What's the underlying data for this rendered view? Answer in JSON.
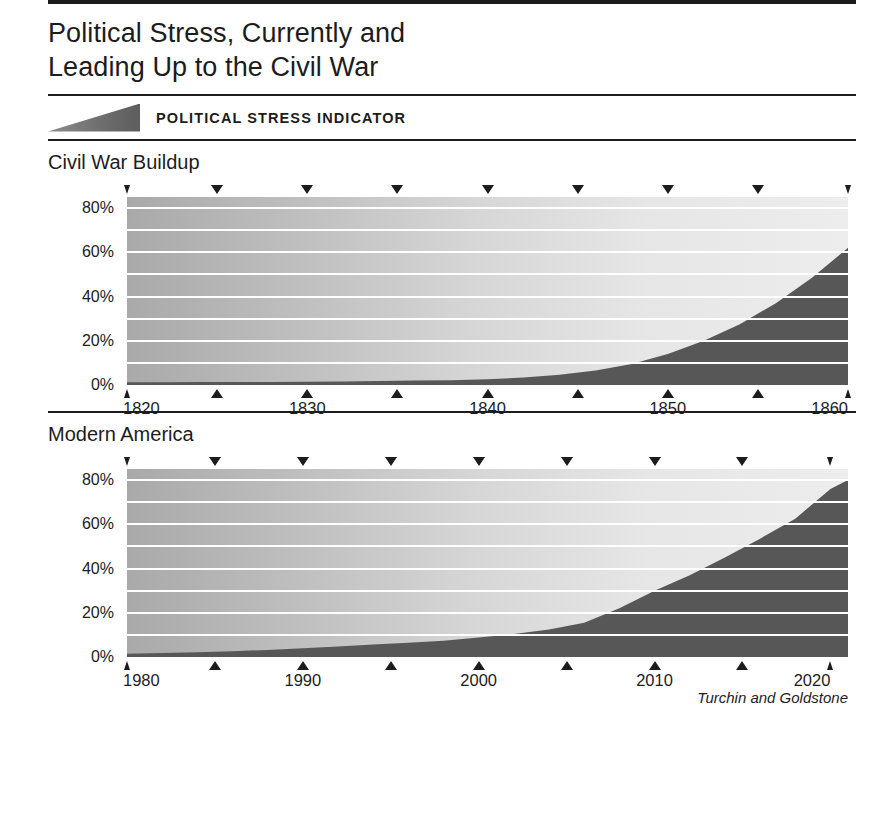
{
  "header": {
    "title_line1": "Political Stress, Currently and",
    "title_line2": "Leading Up to the Civil War"
  },
  "legend": {
    "label": "POLITICAL STRESS INDICATOR",
    "wedge_icon": "wedge-ramp-icon"
  },
  "credit": "Turchin and Goldstone",
  "colors": {
    "ink": "#1c1c1c",
    "dark_area": "#575757",
    "light_area_left": "#a9a9a9",
    "light_area_right": "#ededed",
    "gridline": "#ffffff"
  },
  "chart_data": [
    {
      "type": "area",
      "title": "Civil War Buildup",
      "xlabel": "",
      "ylabel": "",
      "xlim": [
        1820,
        1860
      ],
      "ylim": [
        0,
        85
      ],
      "grid": true,
      "gridlines": [
        0,
        10,
        20,
        30,
        40,
        50,
        60,
        70,
        80
      ],
      "ytick_labels": [
        "0%",
        "20%",
        "40%",
        "60%",
        "80%"
      ],
      "ytick_values": [
        0,
        20,
        40,
        60,
        80
      ],
      "xtick_values": [
        1820,
        1825,
        1830,
        1835,
        1840,
        1845,
        1850,
        1855,
        1860
      ],
      "xtick_labels": [
        "1820",
        "",
        "1830",
        "",
        "1840",
        "",
        "1850",
        "",
        "1860"
      ],
      "legend_position": "top",
      "series": [
        {
          "name": "Political Stress Indicator",
          "x": [
            1820,
            1822,
            1824,
            1826,
            1828,
            1830,
            1832,
            1834,
            1836,
            1838,
            1840,
            1842,
            1844,
            1846,
            1848,
            1850,
            1852,
            1854,
            1856,
            1858,
            1860
          ],
          "values": [
            1.2,
            1.2,
            1.3,
            1.3,
            1.4,
            1.5,
            1.6,
            1.8,
            2.0,
            2.2,
            2.6,
            3.4,
            4.6,
            6.5,
            9.5,
            14.0,
            20.0,
            27.5,
            37.0,
            48.5,
            62.0
          ]
        }
      ]
    },
    {
      "type": "area",
      "title": "Modern America",
      "xlabel": "",
      "ylabel": "",
      "xlim": [
        1980,
        2021
      ],
      "ylim": [
        0,
        85
      ],
      "grid": true,
      "gridlines": [
        0,
        10,
        20,
        30,
        40,
        50,
        60,
        70,
        80
      ],
      "ytick_labels": [
        "0%",
        "20%",
        "40%",
        "60%",
        "80%"
      ],
      "ytick_values": [
        0,
        20,
        40,
        60,
        80
      ],
      "xtick_values": [
        1980,
        1985,
        1990,
        1995,
        2000,
        2005,
        2010,
        2015,
        2020
      ],
      "xtick_labels": [
        "1980",
        "",
        "1990",
        "",
        "2000",
        "",
        "2010",
        "",
        "2020"
      ],
      "legend_position": "top",
      "series": [
        {
          "name": "Political Stress Indicator",
          "x": [
            1980,
            1982,
            1984,
            1986,
            1988,
            1990,
            1992,
            1994,
            1996,
            1998,
            2000,
            2002,
            2004,
            2006,
            2008,
            2010,
            2012,
            2014,
            2016,
            2018,
            2020,
            2021
          ],
          "values": [
            1.5,
            1.8,
            2.2,
            2.6,
            3.2,
            4.0,
            4.8,
            5.6,
            6.4,
            7.4,
            8.8,
            10.4,
            12.4,
            15.5,
            22.0,
            30.0,
            37.0,
            45.0,
            53.5,
            62.5,
            76.0,
            80.0
          ]
        }
      ]
    }
  ]
}
